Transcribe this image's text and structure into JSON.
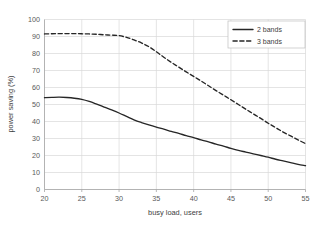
{
  "chart_data": {
    "type": "line",
    "title": "",
    "xlabel": "busy load, users",
    "ylabel": "power saving (%)",
    "xlim": [
      20,
      55
    ],
    "ylim": [
      0,
      100
    ],
    "xticks": [
      20,
      25,
      30,
      35,
      40,
      45,
      50,
      55
    ],
    "yticks": [
      0,
      10,
      20,
      30,
      40,
      50,
      60,
      70,
      80,
      90,
      100
    ],
    "grid": true,
    "legend_position": "top-right",
    "series": [
      {
        "name": "2 bands",
        "style": "solid",
        "color": "#262626",
        "x": [
          20,
          21,
          22,
          23,
          24,
          25,
          26,
          27,
          28,
          29,
          30,
          31,
          32,
          33,
          34,
          35,
          36,
          37,
          38,
          39,
          40,
          41,
          42,
          43,
          44,
          45,
          46,
          47,
          48,
          49,
          50,
          51,
          52,
          53,
          54,
          55
        ],
        "values": [
          54.0,
          54.2,
          54.3,
          54.1,
          53.7,
          53.0,
          51.8,
          50.2,
          48.5,
          46.8,
          45.0,
          43.0,
          41.0,
          39.4,
          38.0,
          36.7,
          35.5,
          34.2,
          33.0,
          31.7,
          30.5,
          29.2,
          28.0,
          26.7,
          25.5,
          24.2,
          23.0,
          22.0,
          21.0,
          20.0,
          19.0,
          17.8,
          16.8,
          15.8,
          14.8,
          14.0
        ]
      },
      {
        "name": "3 bands",
        "style": "dashed",
        "color": "#262626",
        "x": [
          20,
          21,
          22,
          23,
          24,
          25,
          26,
          27,
          28,
          29,
          30,
          31,
          32,
          33,
          34,
          35,
          36,
          37,
          38,
          39,
          40,
          41,
          42,
          43,
          44,
          45,
          46,
          47,
          48,
          49,
          50,
          51,
          52,
          53,
          54,
          55
        ],
        "values": [
          91.5,
          91.6,
          91.7,
          91.7,
          91.7,
          91.6,
          91.5,
          91.3,
          91.0,
          90.8,
          90.5,
          89.5,
          88.0,
          86.2,
          84.0,
          81.0,
          77.8,
          74.8,
          72.0,
          69.2,
          66.5,
          63.8,
          61.0,
          58.2,
          55.5,
          52.8,
          50.0,
          47.2,
          44.5,
          41.8,
          39.0,
          36.4,
          33.8,
          31.5,
          29.2,
          27.0
        ]
      }
    ]
  },
  "legend": {
    "entries": [
      {
        "label": "2 bands",
        "style": "solid"
      },
      {
        "label": "3 bands",
        "style": "dashed"
      }
    ]
  },
  "colors": {
    "grid": "#d9d9d9",
    "axis": "#a6a6a6",
    "text": "#595959",
    "series": "#262626",
    "background": "#ffffff"
  }
}
